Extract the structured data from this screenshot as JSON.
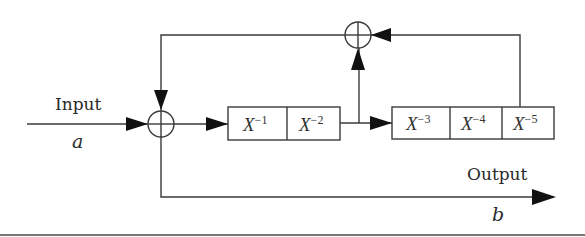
{
  "diagram": {
    "type": "shift-register feedback block diagram",
    "input": {
      "label": "Input",
      "symbol": "a"
    },
    "output": {
      "label": "Output",
      "symbol": "b"
    },
    "adders": [
      {
        "id": "adder-input",
        "symbol": "⊕"
      },
      {
        "id": "adder-feedback",
        "symbol": "⊕"
      }
    ],
    "register_1": {
      "cells": [
        {
          "base": "X",
          "exp": "−1"
        },
        {
          "base": "X",
          "exp": "−2"
        }
      ]
    },
    "register_2": {
      "cells": [
        {
          "base": "X",
          "exp": "−3"
        },
        {
          "base": "X",
          "exp": "−4"
        },
        {
          "base": "X",
          "exp": "−5"
        }
      ]
    },
    "colors": {
      "line": "#3a3a3a",
      "arrow": "#111111",
      "background": "#ffffff"
    }
  }
}
